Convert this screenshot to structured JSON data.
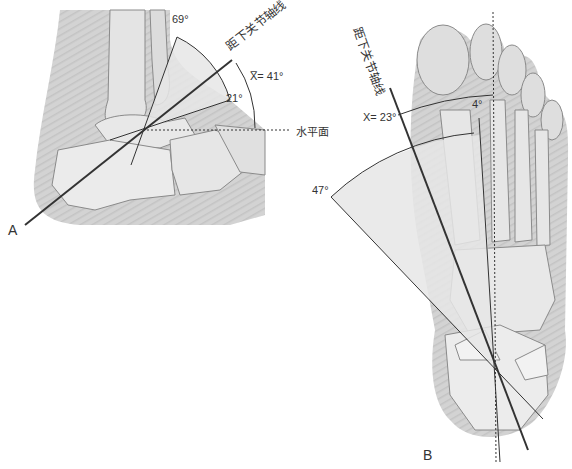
{
  "figure": {
    "panel_a": {
      "label": "A",
      "axis_label": "距下关节轴线",
      "horizontal_label": "水平面",
      "angle_max": "69°",
      "angle_min": "21°",
      "angle_mean": "X̅= 41°"
    },
    "panel_b": {
      "label": "B",
      "axis_label": "距下关节轴线",
      "angle_mean": "X= 23°",
      "angle_min": "4°",
      "angle_max": "47°"
    },
    "colors": {
      "line": "#333333",
      "wedge_fill": "#e6e6e6",
      "bone": "#d9d9d9",
      "soft_tissue": "#bdbdbd"
    }
  }
}
